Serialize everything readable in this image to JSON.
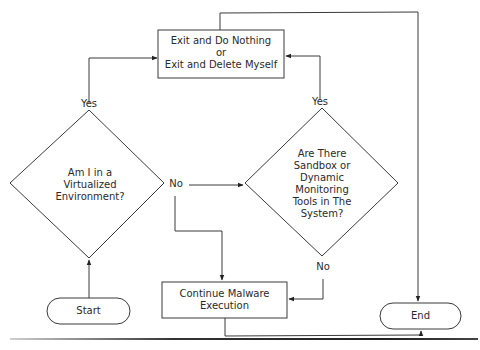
{
  "nodes": {
    "exit": {
      "label": "Exit and Do Nothing\nor\nExit and Delete Myself",
      "shape": "rectangle"
    },
    "virtualized": {
      "label": "Am I in a\nVirtualized\nEnvironment?",
      "shape": "diamond"
    },
    "sandbox": {
      "label": "Are There\nSandbox or\nDynamic\nMonitoring\nTools in The\nSystem?",
      "shape": "diamond"
    },
    "continue": {
      "label": "Continue Malware\nExecution",
      "shape": "rectangle"
    },
    "start": {
      "label": "Start",
      "shape": "terminator"
    },
    "end": {
      "label": "End",
      "shape": "terminator"
    }
  },
  "edges": [
    {
      "from": "start",
      "to": "virtualized",
      "label": ""
    },
    {
      "from": "virtualized",
      "to": "exit",
      "label": "Yes"
    },
    {
      "from": "virtualized",
      "to": "sandbox",
      "label": "No"
    },
    {
      "from": "virtualized",
      "to": "continue",
      "label": "No"
    },
    {
      "from": "sandbox",
      "to": "exit",
      "label": "Yes"
    },
    {
      "from": "sandbox",
      "to": "continue",
      "label": "No"
    },
    {
      "from": "exit",
      "to": "end",
      "label": ""
    },
    {
      "from": "continue",
      "to": "end",
      "label": ""
    }
  ],
  "labels": {
    "yes_left": "Yes",
    "yes_right": "Yes",
    "no_left": "No",
    "no_right": "No"
  },
  "colors": {
    "stroke": "#3a3a3a",
    "background": "#ffffff"
  }
}
